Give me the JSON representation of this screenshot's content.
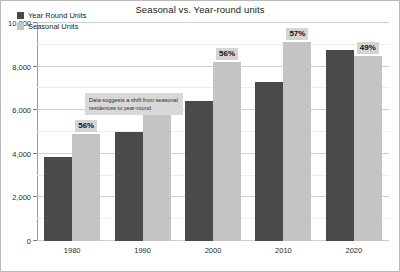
{
  "chart_data": {
    "type": "bar",
    "title": "Seasonal vs. Year-round units",
    "xlabel": "",
    "ylabel": "",
    "categories": [
      "1980",
      "1990",
      "2000",
      "2010",
      "2020"
    ],
    "series": [
      {
        "name": "Year Round Units",
        "color": "#4a4a4a",
        "values": [
          3850,
          5000,
          6400,
          7300,
          8750
        ]
      },
      {
        "name": "Seasonal Units",
        "color": "#c4c4c4",
        "values": [
          4900,
          5950,
          8200,
          9150,
          8500
        ]
      }
    ],
    "point_labels": [
      "56%",
      "57%",
      "56%",
      "57%",
      "49%"
    ],
    "ylim": [
      0,
      10000
    ],
    "yticks": [
      0,
      2000,
      4000,
      6000,
      8000,
      10000
    ],
    "ytick_labels": [
      "0",
      "2,000",
      "4,000",
      "6,000",
      "8,000",
      "10,000"
    ],
    "grid": true,
    "legend_position": "top-left",
    "annotations": [
      {
        "text": "Data suggests a shift from seasonal residences to year-round."
      }
    ]
  },
  "legend": {
    "items": [
      {
        "label": "Year Round Units"
      },
      {
        "label": "Seasonal Units"
      }
    ]
  }
}
